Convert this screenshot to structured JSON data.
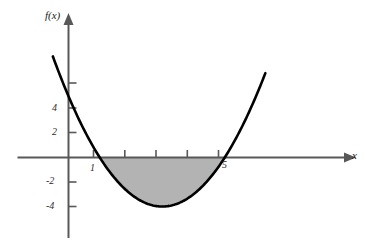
{
  "figure": {
    "title": "",
    "background_color": "#ffffff",
    "width": 372,
    "height": 246
  },
  "axes": {
    "x_axis_label": "x",
    "y_axis_label": "f(x)",
    "x_tick_labels": [
      "1",
      "5"
    ],
    "y_tick_labels": [
      "4",
      "2",
      "-2",
      "-4"
    ],
    "x_tick_label_1": "1",
    "x_tick_label_5": "5",
    "y_tick_label_4": "4",
    "y_tick_label_2": "2",
    "y_tick_label_m2": "-2",
    "y_tick_label_m4": "-4"
  },
  "colors": {
    "curve": "#000000",
    "axis": "#58585a",
    "shading": "#b3b3b3",
    "text": "#1a1a1a"
  },
  "chart_data": {
    "type": "line",
    "title": "",
    "subtitle": "",
    "xlabel": "x",
    "ylabel": "f(x)",
    "xlim": [
      -0.55,
      6.6
    ],
    "ylim": [
      -6.5,
      7.3
    ],
    "grid": false,
    "legend": null,
    "function": "f(x) = x^2 - 6x + 5",
    "roots": [
      1,
      5
    ],
    "vertex": [
      3,
      -4
    ],
    "y_intercept": 5,
    "x_ticks": [
      1,
      2,
      3,
      4,
      5
    ],
    "x_ticks_labeled": [
      1,
      5
    ],
    "y_ticks": [
      -4,
      -2,
      2,
      4,
      6
    ],
    "y_ticks_labeled": [
      -4,
      -2,
      2,
      4
    ],
    "shaded_region": {
      "from": 1,
      "to": 5,
      "description": "region between curve and x-axis",
      "fill": "#b3b3b3"
    },
    "series": [
      {
        "name": "f(x) = x^2 - 6x + 5",
        "x": [
          -0.5,
          0,
          0.5,
          1,
          1.5,
          2,
          2.5,
          3,
          3.5,
          4,
          4.5,
          5,
          5.5,
          6,
          6.3
        ],
        "values": [
          8.25,
          5,
          2.25,
          0,
          -1.75,
          -3,
          -3.75,
          -4,
          -3.75,
          -3,
          -1.75,
          0,
          2.25,
          5,
          6.89
        ]
      }
    ]
  }
}
